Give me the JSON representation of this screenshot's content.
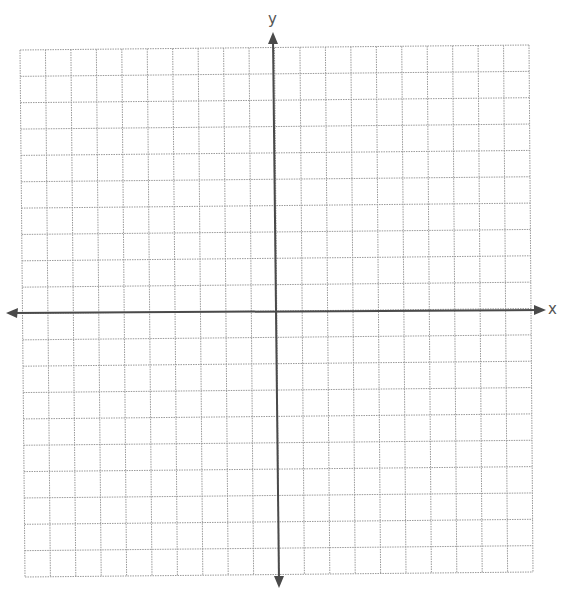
{
  "chart_data": {
    "type": "scatter",
    "title": "",
    "xlabel": "x",
    "ylabel": "y",
    "xlim": [
      -10,
      10
    ],
    "ylim": [
      -10,
      10
    ],
    "grid": true,
    "grid_step": 1,
    "grid_style": "dotted",
    "tick_labels": [],
    "series": [],
    "legend": null,
    "axes_arrows": true,
    "colors": {
      "grid": "#9a9a9a",
      "axis": "#505050",
      "label": "#555555"
    }
  },
  "labels": {
    "x_axis": "x",
    "y_axis": "y"
  }
}
